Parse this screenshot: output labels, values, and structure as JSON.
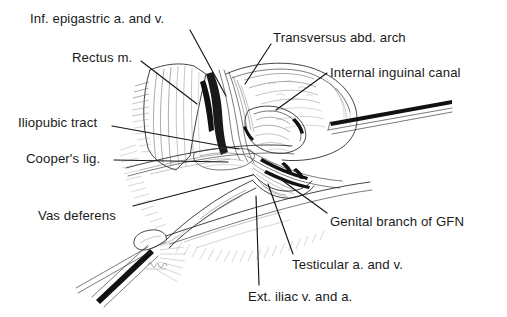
{
  "figure": {
    "type": "anatomical-line-illustration",
    "style": "pen-and-ink hatched medical illustration, black on white",
    "signature": "artist signature",
    "colors": {
      "background": "#ffffff",
      "ink": "#1a1a1a",
      "hatch": "#6e6e6e",
      "leader": "#151515"
    }
  },
  "labels": [
    {
      "id": "inf-epigastric",
      "text": "Inf. epigastric a. and v.",
      "x": 30,
      "y": 12,
      "leader": "M 190 30 L 226 96"
    },
    {
      "id": "rectus-m",
      "text": "Rectus m.",
      "x": 72,
      "y": 51,
      "leader": "M 141 61 L 197 104"
    },
    {
      "id": "transversus-arch",
      "text": "Transversus abd. arch",
      "x": 273,
      "y": 31,
      "leader": "M 271 44 L 245 84"
    },
    {
      "id": "internal-inguinal-canal",
      "text": "Internal inguinal canal",
      "x": 330,
      "y": 66,
      "leader": "M 327 73 L 276 110"
    },
    {
      "id": "iliopubic-tract",
      "text": "Iliopubic tract",
      "x": 18,
      "y": 116,
      "leader": "M 112 126 L 239 149"
    },
    {
      "id": "coopers-lig",
      "text": "Cooper's lig.",
      "x": 26,
      "y": 152,
      "leader": "M 114 160 L 228 162"
    },
    {
      "id": "vas-deferens",
      "text": "Vas deferens",
      "x": 38,
      "y": 209,
      "leader": "M 133 206 L 253 175"
    },
    {
      "id": "genital-branch-gfn",
      "text": "Genital branch of GFN",
      "x": 330,
      "y": 215,
      "leader": "M 327 213 L 283 181"
    },
    {
      "id": "testicular-a-v",
      "text": "Testicular a. and v.",
      "x": 292,
      "y": 258,
      "leader": "M 293 254 L 268 184"
    },
    {
      "id": "ext-iliac-v-a",
      "text": "Ext. iliac v. and a.",
      "x": 248,
      "y": 290,
      "leader": "M 259 285 L 256 196"
    }
  ]
}
